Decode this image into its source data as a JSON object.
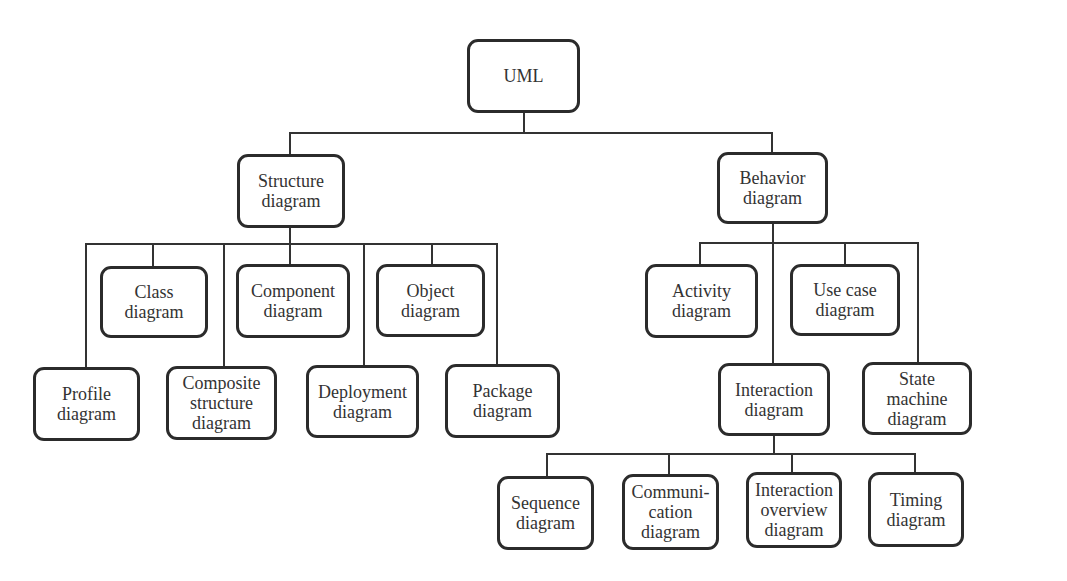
{
  "colors": {
    "line": "#333333",
    "border": "#2b2b2b",
    "text": "#333333",
    "background": "#ffffff"
  },
  "diagram": {
    "nodes": [
      {
        "id": "uml",
        "label": "UML",
        "x": 467,
        "y": 39,
        "w": 113,
        "h": 74
      },
      {
        "id": "structure",
        "label": "Structure\ndiagram",
        "x": 237,
        "y": 154,
        "w": 108,
        "h": 74
      },
      {
        "id": "behavior",
        "label": "Behavior\ndiagram",
        "x": 717,
        "y": 152,
        "w": 111,
        "h": 72
      },
      {
        "id": "class",
        "label": "Class\ndiagram",
        "x": 100,
        "y": 266,
        "w": 108,
        "h": 72
      },
      {
        "id": "component",
        "label": "Component\ndiagram",
        "x": 236,
        "y": 264,
        "w": 114,
        "h": 74
      },
      {
        "id": "object",
        "label": "Object\ndiagram",
        "x": 376,
        "y": 264,
        "w": 109,
        "h": 73
      },
      {
        "id": "profile",
        "label": "Profile\ndiagram",
        "x": 33,
        "y": 367,
        "w": 107,
        "h": 74
      },
      {
        "id": "composite",
        "label": "Composite\nstructure\ndiagram",
        "x": 166,
        "y": 366,
        "w": 111,
        "h": 74
      },
      {
        "id": "deployment",
        "label": "Deployment\ndiagram",
        "x": 306,
        "y": 365,
        "w": 113,
        "h": 73
      },
      {
        "id": "package",
        "label": "Package\ndiagram",
        "x": 445,
        "y": 364,
        "w": 115,
        "h": 74
      },
      {
        "id": "activity",
        "label": "Activity\ndiagram",
        "x": 645,
        "y": 264,
        "w": 113,
        "h": 74
      },
      {
        "id": "usecase",
        "label": "Use case\ndiagram",
        "x": 790,
        "y": 264,
        "w": 110,
        "h": 72
      },
      {
        "id": "interaction",
        "label": "Interaction\ndiagram",
        "x": 718,
        "y": 363,
        "w": 112,
        "h": 73
      },
      {
        "id": "statemachine",
        "label": "State\nmachine\ndiagram",
        "x": 862,
        "y": 362,
        "w": 110,
        "h": 73
      },
      {
        "id": "sequence",
        "label": "Sequence\ndiagram",
        "x": 497,
        "y": 476,
        "w": 97,
        "h": 74
      },
      {
        "id": "communication",
        "label": "Communi-\ncation\ndiagram",
        "x": 622,
        "y": 474,
        "w": 97,
        "h": 76
      },
      {
        "id": "interactionoverview",
        "label": "Interaction\noverview\ndiagram",
        "x": 746,
        "y": 472,
        "w": 96,
        "h": 76
      },
      {
        "id": "timing",
        "label": "Timing\ndiagram",
        "x": 868,
        "y": 472,
        "w": 96,
        "h": 75
      }
    ],
    "edges": [
      {
        "from": "uml",
        "to": [
          "structure",
          "behavior"
        ]
      },
      {
        "from": "structure",
        "to": [
          "profile",
          "class",
          "composite",
          "component",
          "deployment",
          "object",
          "package"
        ]
      },
      {
        "from": "behavior",
        "to": [
          "activity",
          "interaction",
          "usecase",
          "statemachine"
        ]
      },
      {
        "from": "interaction",
        "to": [
          "sequence",
          "communication",
          "interactionoverview",
          "timing"
        ]
      }
    ],
    "connector_segments": [
      [
        524,
        113,
        524,
        133
      ],
      [
        290,
        133,
        772,
        133
      ],
      [
        290,
        133,
        290,
        154
      ],
      [
        772,
        133,
        772,
        152
      ],
      [
        290,
        228,
        290,
        244
      ],
      [
        86,
        244,
        497,
        244
      ],
      [
        86,
        244,
        86,
        367
      ],
      [
        153,
        244,
        153,
        266
      ],
      [
        224,
        244,
        224,
        366
      ],
      [
        290,
        244,
        290,
        264
      ],
      [
        364,
        244,
        364,
        365
      ],
      [
        432,
        244,
        432,
        264
      ],
      [
        497,
        244,
        497,
        364
      ],
      [
        773,
        224,
        773,
        363
      ],
      [
        700,
        243,
        918,
        243
      ],
      [
        700,
        243,
        700,
        264
      ],
      [
        845,
        243,
        845,
        264
      ],
      [
        918,
        243,
        918,
        362
      ],
      [
        774,
        436,
        774,
        454
      ],
      [
        547,
        454,
        915,
        454
      ],
      [
        547,
        454,
        547,
        476
      ],
      [
        669,
        454,
        669,
        474
      ],
      [
        792,
        454,
        792,
        472
      ],
      [
        915,
        454,
        915,
        472
      ]
    ]
  }
}
